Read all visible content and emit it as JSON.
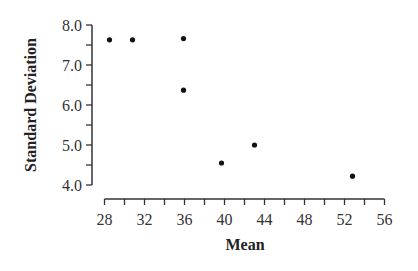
{
  "chart_data": {
    "type": "scatter",
    "title": "",
    "xlabel": "Mean",
    "ylabel": "Standard Deviation",
    "xlim": [
      28,
      56
    ],
    "ylim": [
      4.0,
      8.0
    ],
    "x_ticks": [
      "28",
      "32",
      "36",
      "40",
      "44",
      "48",
      "52",
      "56"
    ],
    "y_ticks": [
      "4.0",
      "5.0",
      "6.0",
      "7.0",
      "8.0"
    ],
    "grid": false,
    "legend": null,
    "points": [
      {
        "x": 28.5,
        "y": 7.63
      },
      {
        "x": 30.8,
        "y": 7.63
      },
      {
        "x": 35.9,
        "y": 7.66
      },
      {
        "x": 35.9,
        "y": 6.37
      },
      {
        "x": 39.7,
        "y": 4.55
      },
      {
        "x": 43.0,
        "y": 5.0
      },
      {
        "x": 52.8,
        "y": 4.22
      }
    ],
    "colors": {
      "point": "#111111",
      "axis": "#333333"
    }
  }
}
